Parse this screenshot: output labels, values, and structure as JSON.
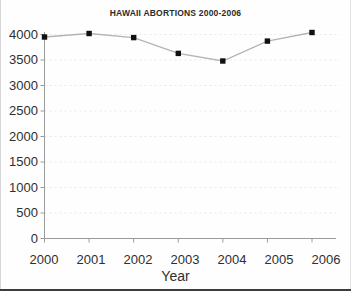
{
  "chart_data": {
    "type": "line",
    "title": "HAWAII ABORTIONS 2000-2006",
    "xlabel": "Year",
    "ylabel": "",
    "categories": [
      "2000",
      "2001",
      "2002",
      "2003",
      "2004",
      "2005",
      "2006"
    ],
    "values": [
      3950,
      4020,
      3940,
      3630,
      3480,
      3870,
      4040
    ],
    "series": [
      {
        "name": "Abortions",
        "values": [
          3950,
          4020,
          3940,
          3630,
          3480,
          3870,
          4040
        ]
      }
    ],
    "ylim": [
      0,
      4000
    ],
    "xlim": [
      "2000",
      "2006"
    ],
    "ytick_labels": [
      "4000",
      "3500",
      "3000",
      "2500",
      "2000",
      "1500",
      "1000",
      "500",
      "0"
    ],
    "ytick_values": [
      4000,
      3500,
      3000,
      2500,
      2000,
      1500,
      1000,
      500,
      0
    ],
    "xtick_labels": [
      "2000",
      "2001",
      "2002",
      "2003",
      "2004",
      "2005",
      "2006"
    ],
    "grid": "horizontal-dotted",
    "legend": "none",
    "marker": "square",
    "colors": {
      "line": "#b4b4b4",
      "marker": "#111111",
      "grid": "#e8e8e8",
      "axis": "#9a9a9a",
      "text": "#2f2f2f",
      "background": "#fefefe"
    }
  }
}
